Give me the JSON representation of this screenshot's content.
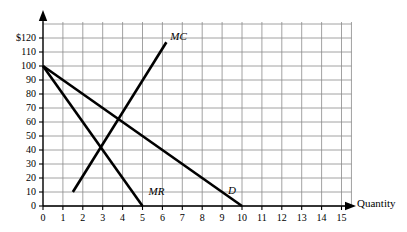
{
  "chart_data": {
    "type": "line",
    "title": "",
    "xlabel": "Quantity",
    "ylabel": "",
    "xlim": [
      0,
      15.5
    ],
    "ylim": [
      0,
      130
    ],
    "grid": true,
    "legend_position": "inline-labels",
    "x_ticks": [
      "0",
      "1",
      "2",
      "3",
      "4",
      "5",
      "6",
      "7",
      "8",
      "9",
      "10",
      "11",
      "12",
      "13",
      "14",
      "15"
    ],
    "x_tick_values": [
      0,
      1,
      2,
      3,
      4,
      5,
      6,
      7,
      8,
      9,
      10,
      11,
      12,
      13,
      14,
      15
    ],
    "y_ticks": [
      "0",
      "10",
      "20",
      "30",
      "40",
      "50",
      "60",
      "70",
      "80",
      "90",
      "100",
      "110",
      "$120"
    ],
    "y_tick_values": [
      0,
      10,
      20,
      30,
      40,
      50,
      60,
      70,
      80,
      90,
      100,
      110,
      120
    ],
    "series": [
      {
        "name": "D",
        "label": "D",
        "label_x": 9.3,
        "label_y": 11,
        "points": [
          [
            0,
            100
          ],
          [
            10,
            0
          ]
        ],
        "color": "#000000"
      },
      {
        "name": "MR",
        "label": "MR",
        "label_x": 5.3,
        "label_y": 10,
        "points": [
          [
            0,
            100
          ],
          [
            5,
            0
          ]
        ],
        "color": "#000000"
      },
      {
        "name": "MC",
        "label": "MC",
        "label_x": 6.4,
        "label_y": 121,
        "points": [
          [
            1.5,
            10
          ],
          [
            6.2,
            117
          ]
        ],
        "color": "#000000"
      }
    ],
    "intersections": [
      {
        "label": "MC x MR",
        "x": 3,
        "y": 40
      },
      {
        "label": "MC x D",
        "x": 4,
        "y": 60
      }
    ],
    "colors": {
      "curve": "#000000",
      "grid": "#8a8a8a",
      "axis": "#000000",
      "background": "#ffffff"
    }
  },
  "axis_titles": {
    "x": "Quantity"
  }
}
